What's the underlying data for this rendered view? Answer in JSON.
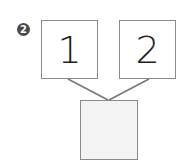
{
  "problem": {
    "number_badge": "2",
    "top_boxes": [
      {
        "value": "1"
      },
      {
        "value": "2"
      }
    ],
    "bottom_box": {
      "value": ""
    }
  },
  "colors": {
    "badge_bg": "#4a4a4a",
    "box_border": "#8a8a8a",
    "connector_line": "#777777",
    "answer_box_fill": "#f3f3f3"
  }
}
